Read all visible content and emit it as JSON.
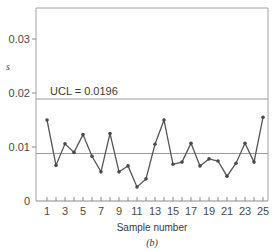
{
  "chart_data": {
    "type": "line",
    "title": "",
    "panel_label": "(b)",
    "xlabel": "Sample number",
    "ylabel": "s",
    "ylim": [
      0,
      0.035
    ],
    "xlim": [
      0.5,
      25.8
    ],
    "y_ticks": [
      0,
      0.01,
      0.02,
      0.03
    ],
    "y_tick_labels": [
      "0",
      "0.01",
      "0.02",
      "0.03"
    ],
    "x_tick_labels": [
      "1",
      "3",
      "5",
      "7",
      "9",
      "11",
      "13",
      "15",
      "17",
      "19",
      "21",
      "23",
      "25"
    ],
    "x_ticks": [
      1,
      3,
      5,
      7,
      9,
      11,
      13,
      15,
      17,
      19,
      21,
      23,
      25
    ],
    "grid": false,
    "x": [
      1,
      2,
      3,
      4,
      5,
      6,
      7,
      8,
      9,
      10,
      11,
      12,
      13,
      14,
      15,
      16,
      17,
      18,
      19,
      20,
      21,
      22,
      23,
      24,
      25
    ],
    "series": [
      {
        "name": "s",
        "values": [
          0.015,
          0.0066,
          0.0106,
          0.009,
          0.0123,
          0.0083,
          0.0054,
          0.0125,
          0.0054,
          0.0065,
          0.0026,
          0.0041,
          0.0105,
          0.015,
          0.0068,
          0.0072,
          0.0107,
          0.0065,
          0.0078,
          0.0074,
          0.0046,
          0.007,
          0.0107,
          0.0072,
          0.0155
        ]
      }
    ],
    "reference_lines": [
      {
        "name": "UCL",
        "value": 0.0196,
        "label": "UCL = 0.0196"
      },
      {
        "name": "Center line",
        "value": 0.0088,
        "label": ""
      }
    ],
    "colors": {
      "line": "#555555",
      "marker": "#4a4a4a",
      "axis": "#8a8a8a",
      "ref": "#9a9a9a"
    }
  }
}
